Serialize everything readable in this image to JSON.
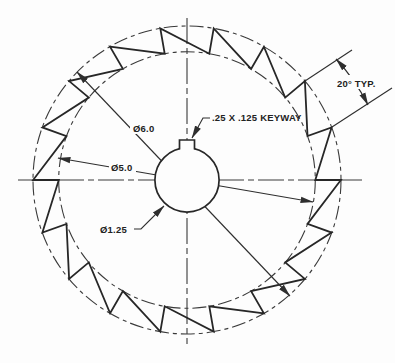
{
  "drawing": {
    "labels": {
      "outer_diameter": "Ø6.0",
      "root_diameter": "Ø5.0",
      "bore_diameter": "Ø1.25",
      "keyway_note": ".25 X .125 KEYWAY",
      "tooth_angle": "20° TYP."
    },
    "geometry": {
      "teeth_count": 18,
      "tooth_pitch_deg": 20,
      "outer_dia_in": 6.0,
      "root_dia_in": 5.0,
      "bore_dia_in": 1.25,
      "keyway_width_in": 0.25,
      "keyway_depth_in": 0.125
    },
    "colors": {
      "line": "#2e2e2e",
      "background": "#fdfdfd"
    }
  }
}
